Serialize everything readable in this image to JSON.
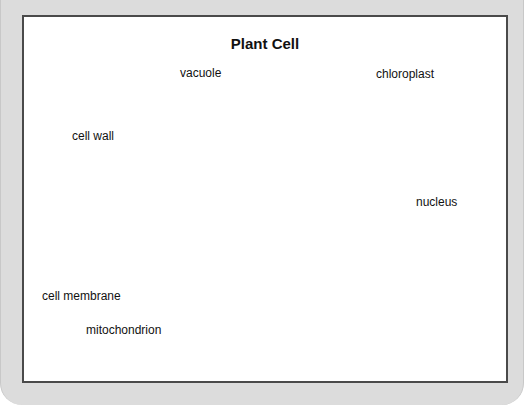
{
  "figure": {
    "title": "Plant Cell",
    "labels": {
      "vacuole": "vacuole",
      "chloroplast": "chloroplast",
      "cell_wall": "cell wall",
      "nucleus": "nucleus",
      "cell_membrane": "cell membrane",
      "mitochondrion": "mitochondrion"
    }
  },
  "colors": {
    "frame_bg": "#dcdcdc",
    "panel_border": "#4a4a4a",
    "cytoplasm": "#9a9a9a",
    "wall": "#6e6e6e",
    "organelle_dark": "#3a3a3a",
    "vacuole": "#ffffff"
  }
}
